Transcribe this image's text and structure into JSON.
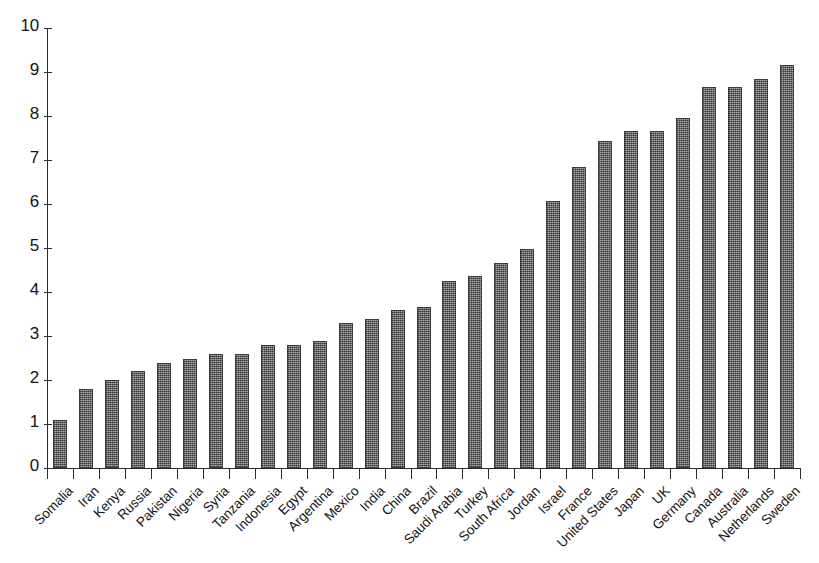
{
  "chart_data": {
    "type": "bar",
    "title": "",
    "subtitle": "",
    "xlabel": "",
    "ylabel": "",
    "ylim": [
      0,
      10
    ],
    "ytick_values": [
      0,
      1,
      2,
      3,
      4,
      5,
      6,
      7,
      8,
      9,
      10
    ],
    "ytick_labels": [
      "0",
      "1",
      "2",
      "3",
      "4",
      "5",
      "6",
      "7",
      "8",
      "9",
      "10"
    ],
    "grid": false,
    "legend": null,
    "bar_color": "#8c8c8c",
    "bar_edge_color": "#3a3a3a",
    "axis_color": "#2b2b2b",
    "categories": [
      "Somalia",
      "Iran",
      "Kenya",
      "Russia",
      "Pakistan",
      "Nigeria",
      "Syria",
      "Tanzania",
      "Indonesia",
      "Egypt",
      "Argentina",
      "Mexico",
      "India",
      "China",
      "Brazil",
      "Saudi Arabia",
      "Turkey",
      "South Africa",
      "Jordan",
      "Israel",
      "France",
      "United States",
      "Japan",
      "UK",
      "Germany",
      "Canada",
      "Australia",
      "Netherlands",
      "Sweden"
    ],
    "values": [
      1.1,
      1.8,
      2.01,
      2.2,
      2.39,
      2.48,
      2.59,
      2.6,
      2.79,
      2.79,
      2.89,
      3.29,
      3.38,
      3.58,
      3.65,
      4.26,
      4.37,
      4.65,
      4.98,
      6.06,
      6.85,
      7.44,
      7.65,
      7.65,
      7.95,
      8.65,
      8.65,
      8.83,
      9.15
    ]
  }
}
